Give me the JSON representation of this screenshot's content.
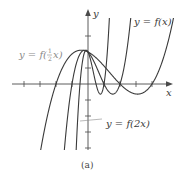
{
  "figure": {
    "caption": "(a)",
    "x_axis_label": "x",
    "y_axis_label": "y",
    "origin_px": [
      88,
      84
    ],
    "unit_px": 16,
    "x_ticks": [
      -4,
      -3,
      -2,
      -1,
      1,
      2,
      3,
      4
    ],
    "y_ticks": [
      -4,
      -3,
      -2,
      -1,
      1,
      3
    ],
    "clip_y_units": [
      -4,
      4
    ],
    "colors": {
      "axis": "#4a4a4a",
      "curve": "#3a3a3a",
      "label_gray": "#8a8a8a"
    }
  },
  "curves": [
    {
      "name": "f(x)",
      "label": "y = f(x)",
      "scale": 1,
      "label_pos": [
        134,
        25
      ],
      "leader": false
    },
    {
      "name": "f(2x)",
      "label": "y = f(2x)",
      "scale": 2,
      "label_pos": [
        106,
        127
      ],
      "leader": [
        [
          80,
          121
        ],
        [
          102,
          119
        ]
      ]
    },
    {
      "name": "f(x/2)",
      "label_prefix": "y = f(",
      "label_frac": "1/2",
      "label_suffix": "x)",
      "scale": 0.5,
      "label_pos": [
        19,
        58
      ],
      "leader": false,
      "gray": true
    }
  ],
  "base_function": {
    "description": "f(x) = (x+1)(x-1)(x-2)",
    "roots": [
      -1,
      1,
      2
    ],
    "f0": 2
  }
}
